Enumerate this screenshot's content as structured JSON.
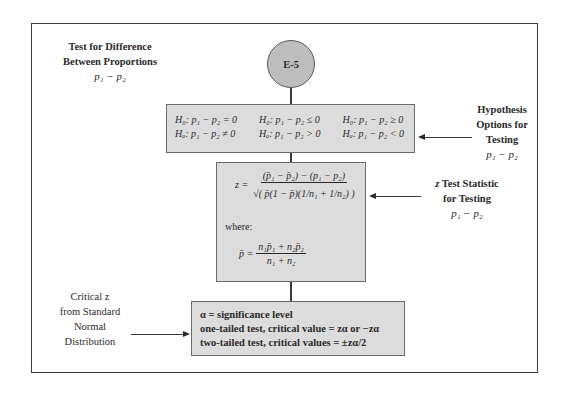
{
  "diagram": {
    "title_block": {
      "line1": "Test for  Difference",
      "line2": "Between Proportions",
      "line3": "p₁ − p₂"
    },
    "node": {
      "id": "E-5"
    },
    "hypothesis_box": {
      "rows": [
        [
          "H₀: p₁ − p₂ = 0",
          "H₀: p₁ − p₂ ≤ 0",
          "H₀: p₁ − p₂ ≥ 0"
        ],
        [
          "Hₐ: p₁ − p₂ ≠ 0",
          "Hₐ: p₁ − p₂ > 0",
          "Hₐ: p₁ − p₂ < 0"
        ]
      ]
    },
    "hypothesis_label": {
      "line1": "Hypothesis",
      "line2": "Options for",
      "line3": "Testing",
      "line4": "p₁ − p₂"
    },
    "statistic_box": {
      "z_lhs": "z =",
      "z_numerator": "(p̄₁ − p̄₂) − (p₁ − p₂)",
      "z_denominator": "√( p̄(1 − p̄)(1/n₁ + 1/n₂) )",
      "where_label": "where:",
      "pbar_lhs": "p̄ =",
      "pbar_numerator": "n₁p̄₁ + n₂p̄₂",
      "pbar_denominator": "n₁ + n₂"
    },
    "statistic_label": {
      "line1": "z Test Statistic",
      "line2": "for Testing",
      "line3": "p₁ − p₂"
    },
    "critical_box": {
      "line1": "α = significance level",
      "line2": "one-tailed test, critical value = zα or −zα",
      "line3": "two-tailed test, critical values = ±zα/2"
    },
    "critical_label": {
      "line1": "Critical z",
      "line2": "from Standard",
      "line3": "Normal",
      "line4": "Distribution"
    },
    "colors": {
      "box_fill": "#dcdcdc",
      "circle_fill": "#bdbdbd",
      "line": "#3a3a3a"
    }
  }
}
